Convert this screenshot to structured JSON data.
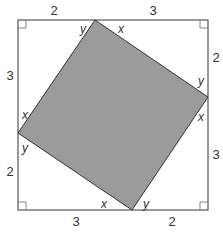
{
  "figure": {
    "colors": {
      "outer_stroke": "#555555",
      "inner_fill": "#9b9b9b",
      "inner_stroke": "#333333",
      "text": "#333333"
    },
    "outer_square": {
      "x": 18,
      "y": 20,
      "size": 190
    },
    "inner_square_vertices": [
      {
        "name": "top",
        "x": 95,
        "y": 20
      },
      {
        "name": "right",
        "x": 208,
        "y": 97
      },
      {
        "name": "bottom",
        "x": 132,
        "y": 210
      },
      {
        "name": "left",
        "x": 18,
        "y": 133
      }
    ],
    "segment_labels": {
      "top_left": "2",
      "top_right": "3",
      "right_top": "2",
      "right_bottom": "3",
      "bottom_right": "2",
      "bottom_left": "3",
      "left_bottom": "2",
      "left_top": "3"
    },
    "angle_labels": {
      "top_vertex_left": "y",
      "top_vertex_right": "x",
      "right_vertex_top": "y",
      "right_vertex_bottom": "x",
      "bottom_vertex_right": "y",
      "bottom_vertex_left": "x",
      "left_vertex_top": "x",
      "left_vertex_bottom": "y"
    }
  }
}
